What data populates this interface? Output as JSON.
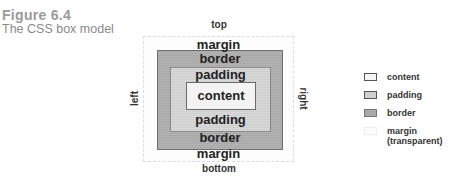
{
  "figure": {
    "number": "Figure 6.4",
    "caption": "The CSS box model"
  },
  "diagram": {
    "side_labels": {
      "top": "top",
      "bottom": "bottom",
      "left": "left",
      "right": "right"
    },
    "layers": {
      "margin_top": "margin",
      "border_top": "border",
      "padding_top": "padding",
      "content": "content",
      "padding_bottom": "padding",
      "border_bottom": "border",
      "margin_bottom": "margin"
    },
    "colors": {
      "content": "#f3f3f3",
      "padding": "#cfcfcf",
      "border": "#a9a9a9",
      "margin": "#fdfdfd"
    }
  },
  "legend": {
    "items": [
      {
        "label": "content"
      },
      {
        "label": "padding"
      },
      {
        "label": "border"
      },
      {
        "label": "margin (transparent)"
      }
    ]
  }
}
